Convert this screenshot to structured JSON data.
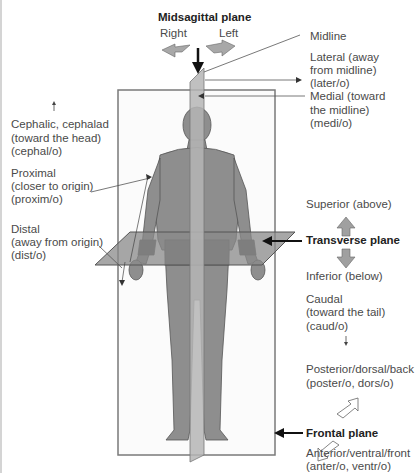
{
  "title": "Midsagittal plane",
  "directions_top": {
    "right": "Right",
    "left": "Left"
  },
  "labels_right": {
    "midline": "Midline",
    "lateral": [
      "Lateral (away",
      "from midline)",
      "(later/o)"
    ],
    "medial": [
      "Medial (toward",
      "the midline)",
      "(medi/o)"
    ],
    "superior": "Superior (above)",
    "transverse_plane": "Transverse plane",
    "inferior": "Inferior (below)",
    "caudal": [
      "Caudal",
      "(toward the tail)",
      "(caud/o)"
    ],
    "posterior": [
      "Posterior/dorsal/back",
      "(poster/o, dors/o)"
    ],
    "frontal_plane": "Frontal plane",
    "anterior": [
      "Anterior/ventral/front",
      "(anter/o, ventr/o)"
    ]
  },
  "labels_left": {
    "cephalic": [
      "Cephalic, cephalad",
      "(toward the head)",
      "(cephal/o)"
    ],
    "proximal": [
      "Proximal",
      "(closer to origin)",
      "(proxim/o)"
    ],
    "distal": [
      "Distal",
      "(away from origin)",
      "(dist/o)"
    ]
  },
  "colors": {
    "plane_gray": "#9a9a9a",
    "body_gray": "#8c8c8c",
    "text": "#4a4a4a",
    "arrow_fill": "#a8a8a8"
  }
}
